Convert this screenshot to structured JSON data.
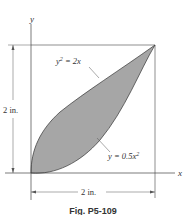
{
  "figure": {
    "caption": "Fig. P5-109",
    "axes": {
      "x_label": "x",
      "y_label": "y"
    },
    "curves": {
      "upper": {
        "equation_lhs": "y",
        "equation_exp": "2",
        "equation_rhs": " = 2x"
      },
      "lower": {
        "equation_lhs": "y = 0.5x",
        "equation_exp": "2"
      }
    },
    "dimensions": {
      "height": "2 in.",
      "width": "2 in."
    },
    "colors": {
      "fill": "#a6a6a6",
      "line": "#333333"
    }
  }
}
